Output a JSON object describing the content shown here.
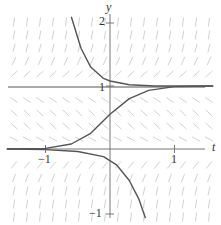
{
  "chart_data": {
    "type": "line",
    "title": "",
    "xlabel": "t",
    "ylabel": "y",
    "xlim": [
      -1.6,
      1.6
    ],
    "ylim": [
      -1.2,
      2.2
    ],
    "x_ticks": [
      {
        "value": -1,
        "label": "−1"
      },
      {
        "value": 1,
        "label": "1"
      }
    ],
    "y_ticks": [
      {
        "value": 2,
        "label": "2"
      },
      {
        "value": 1,
        "label": "1"
      },
      {
        "value": -1,
        "label": "−1"
      }
    ],
    "grid": false,
    "slope_field": true,
    "equilibria": [
      0,
      1
    ],
    "series": [
      {
        "name": "solution above y=1",
        "points": [
          [
            -0.6,
            2.1
          ],
          [
            -0.45,
            1.6
          ],
          [
            -0.3,
            1.3
          ],
          [
            -0.1,
            1.12
          ],
          [
            0.0,
            1.08
          ],
          [
            0.3,
            1.02
          ],
          [
            0.7,
            1.0
          ],
          [
            1.6,
            1.0
          ]
        ]
      },
      {
        "name": "solution between 0 and 1",
        "points": [
          [
            -1.6,
            0.0
          ],
          [
            -1.0,
            0.01
          ],
          [
            -0.6,
            0.08
          ],
          [
            -0.3,
            0.25
          ],
          [
            0.0,
            0.55
          ],
          [
            0.3,
            0.8
          ],
          [
            0.6,
            0.93
          ],
          [
            1.0,
            0.99
          ],
          [
            1.6,
            1.0
          ]
        ]
      },
      {
        "name": "solution below y=0",
        "points": [
          [
            -1.6,
            0.0
          ],
          [
            -1.0,
            -0.01
          ],
          [
            -0.5,
            -0.04
          ],
          [
            -0.1,
            -0.12
          ],
          [
            0.1,
            -0.25
          ],
          [
            0.3,
            -0.5
          ],
          [
            0.45,
            -0.8
          ],
          [
            0.55,
            -1.1
          ]
        ]
      }
    ]
  },
  "axes": {
    "x_label": "t",
    "y_label": "y",
    "tick_x_neg1": "−1",
    "tick_x_1": "1",
    "tick_y_2": "2",
    "tick_y_1": "1",
    "tick_y_neg1": "−1"
  },
  "colors": {
    "curve": "#555555",
    "axis": "#777777",
    "field": "#cccccc"
  }
}
